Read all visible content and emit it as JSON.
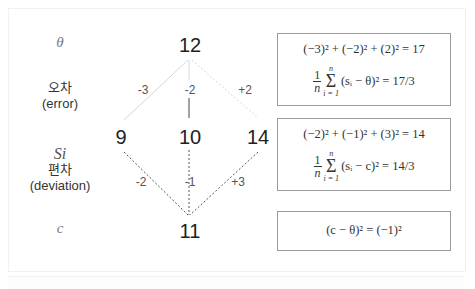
{
  "row_labels": {
    "theta": "θ",
    "error_ko": "오차",
    "error_en": "(error)",
    "si": "Si",
    "deviation_ko": "편차",
    "deviation_en": "(deviation)",
    "c": "c"
  },
  "nodes": {
    "theta_value": "12",
    "s1": "9",
    "s2": "10",
    "s3": "14",
    "c_value": "11"
  },
  "errors": [
    "-3",
    "-2",
    "+2"
  ],
  "deviations": [
    "-2",
    "-1",
    "+3"
  ],
  "boxes": {
    "error_box": {
      "line1": "(−3)² + (−2)² + (2)² = 17",
      "frac_num": "1",
      "frac_den": "n",
      "sum_top": "n",
      "sum_bottom": "i = 1",
      "sum_body": "(sᵢ − θ)² = 17/3"
    },
    "deviation_box": {
      "line1": "(−2)² + (−1)² + (3)² = 14",
      "frac_num": "1",
      "frac_den": "n",
      "sum_top": "n",
      "sum_bottom": "i = 1",
      "sum_body": "(sᵢ − c)² = 14/3"
    },
    "bias_box": {
      "line1": "(c − θ)² = (−1)²"
    }
  },
  "colors": {
    "error_line": "#d0d0d0",
    "deviation_line": "#555555",
    "box_border": "#9a9a9a"
  }
}
